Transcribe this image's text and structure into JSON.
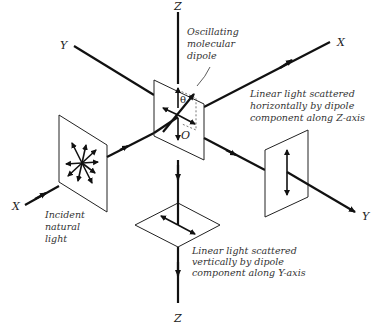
{
  "diagram": {
    "axes": {
      "z_top": "Z",
      "z_bottom": "Z",
      "x_upper_right": "X",
      "x_lower_left": "X",
      "y_upper_left": "Y",
      "y_lower_right": "Y"
    },
    "symbols": {
      "theta": "θ",
      "origin": "O"
    },
    "labels": {
      "dipole": [
        "Oscillating",
        "molecular",
        "dipole"
      ],
      "incident": [
        "Incident",
        "natural",
        "light"
      ],
      "horizontal_scatter": [
        "Linear light scattered",
        "horizontally by dipole",
        "component along Z-axis"
      ],
      "vertical_scatter": [
        "Linear light scattered",
        "vertically  by dipole",
        "component along Y-axis"
      ]
    },
    "colors": {
      "line": "#111111",
      "background": "#ffffff"
    }
  }
}
